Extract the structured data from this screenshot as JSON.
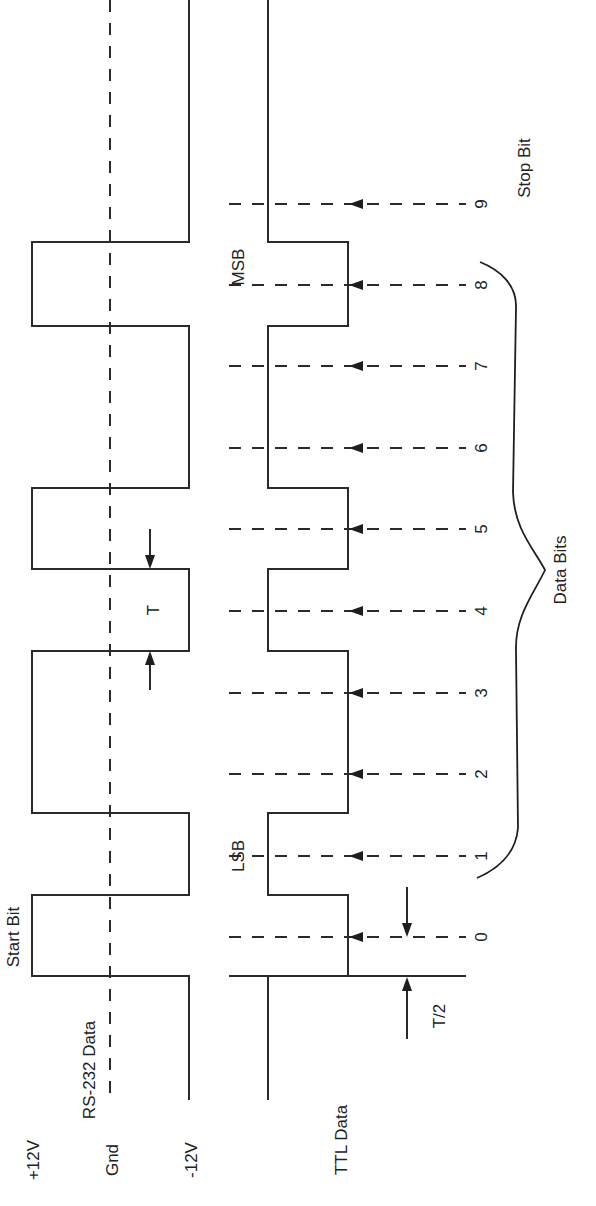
{
  "figure": {
    "orientation": "rotated 90° counter-clockwise (time runs bottom to top)"
  },
  "labels": {
    "plus12v": "+12V",
    "gnd": "Gnd",
    "minus12v": "-12V",
    "rs232": "RS-232 Data",
    "ttl": "TTL Data",
    "start_bit": "Start Bit",
    "stop_bit": "Stop Bit",
    "lsb": "LSB",
    "msb": "MSB",
    "data_bits": "Data Bits",
    "period": "T",
    "half_period": "T/2"
  },
  "bits": [
    {
      "index": "0",
      "role": "start"
    },
    {
      "index": "1",
      "role": "data",
      "tag": "LSB"
    },
    {
      "index": "2",
      "role": "data"
    },
    {
      "index": "3",
      "role": "data"
    },
    {
      "index": "4",
      "role": "data"
    },
    {
      "index": "5",
      "role": "data"
    },
    {
      "index": "6",
      "role": "data"
    },
    {
      "index": "7",
      "role": "data"
    },
    {
      "index": "8",
      "role": "data",
      "tag": "MSB"
    },
    {
      "index": "9",
      "role": "stop"
    }
  ],
  "signals": {
    "rs232_levels": [
      "+12V",
      "Gnd",
      "-12V"
    ],
    "ttl_bit_values": [
      0,
      1,
      0,
      0,
      1,
      0,
      0,
      0,
      1,
      1
    ],
    "rs232_bit_values": [
      1,
      0,
      1,
      1,
      0,
      1,
      1,
      1,
      0,
      0
    ]
  },
  "colors": {
    "line": "#2a2a2a",
    "background": "#ffffff"
  }
}
